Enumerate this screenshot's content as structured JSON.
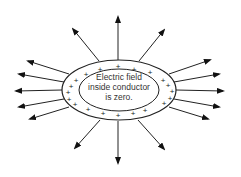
{
  "diagram": {
    "label_lines": [
      "Electric field",
      "inside conductor",
      "is zero."
    ],
    "charge_symbol": "+",
    "colors": {
      "stroke": "#222222",
      "text": "#333333",
      "background": "#ffffff"
    }
  }
}
